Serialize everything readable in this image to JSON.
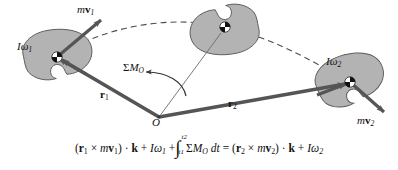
{
  "figure": {
    "background_color": "#ffffff",
    "body_fill": "#b3b3b3",
    "body_stroke": "#4d4d4d",
    "vector_color": "#555555",
    "trajectory_color": "#4d4d4d",
    "text_color": "#111111"
  },
  "bodies": [
    {
      "name": "body-position-1",
      "label": "Iω",
      "sub": "1",
      "angular_momentum": "Iω₁"
    },
    {
      "name": "body-position-mid",
      "label": "",
      "sub": "",
      "angular_momentum": ""
    },
    {
      "name": "body-position-2",
      "label": "Iω",
      "sub": "2",
      "angular_momentum": "Iω₂"
    }
  ],
  "labels": {
    "spin_1": {
      "I": "I",
      "omega": "ω",
      "sub": "1"
    },
    "spin_2": {
      "I": "I",
      "omega": "ω",
      "sub": "2"
    },
    "momentum_1": {
      "m": "m",
      "v": "v",
      "sub": "1"
    },
    "momentum_2": {
      "m": "m",
      "v": "v",
      "sub": "2"
    },
    "radius_1": {
      "r": "r",
      "sub": "1"
    },
    "radius_2": {
      "r": "r",
      "sub": "2"
    },
    "moment": {
      "sigma": "Σ",
      "M": "M",
      "sub": "O"
    },
    "origin": "O"
  },
  "equation": {
    "full_text": "(r₁ × mv₁) · k + Iω₁ + ∫(t₁..t₂) ΣM_O dt = (r₂ × mv₂) · k + Iω₂",
    "lhs": {
      "open": "(",
      "r": "r",
      "r_sub": "1",
      "cross": "×",
      "m": "m",
      "v": "v",
      "v_sub": "1",
      "close": ")",
      "dot": "·",
      "k": "k",
      "plus1": "+",
      "I": "I",
      "omega": "ω",
      "omega_sub": "1",
      "plus2": "+"
    },
    "integral": {
      "symbol": "∫",
      "lower_limit_t": "t",
      "lower_limit_sub": "1",
      "upper_limit_t": "t",
      "upper_limit_sub": "2",
      "sigma": "Σ",
      "M": "M",
      "M_sub": "O",
      "differential": "dt"
    },
    "equals": "=",
    "rhs": {
      "open": "(",
      "r": "r",
      "r_sub": "2",
      "cross": "×",
      "m": "m",
      "v": "v",
      "v_sub": "2",
      "close": ")",
      "dot": "·",
      "k": "k",
      "plus": "+",
      "I": "I",
      "omega": "ω",
      "omega_sub": "2"
    }
  }
}
